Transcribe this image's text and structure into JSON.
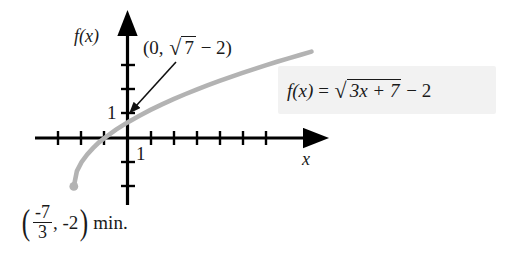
{
  "figure": {
    "background_color": "#ffffff",
    "curve_color": "#b3b3b3",
    "axis_color": "#000000",
    "text_color": "#1a1a1a",
    "callout_bg": "#f2f2f2"
  },
  "labels": {
    "y_axis": "f(x)",
    "x_axis": "x",
    "y_tick_one": "1",
    "x_tick_one": "1"
  },
  "annotations": {
    "intercept": {
      "open": "(0,",
      "radical_symbol": "√",
      "radicand": "7",
      "tail": "− 2)"
    },
    "equation": {
      "lhs": "f(x)",
      "equals": "=",
      "radical_symbol": "√",
      "radicand": "3x + 7",
      "tail": "− 2"
    },
    "minimum": {
      "open_paren": "(",
      "numerator": "-7",
      "denominator": "3",
      "comma_value": ", -2",
      "close_paren": ")",
      "note": "min."
    }
  },
  "chart_data": {
    "type": "line",
    "title": "",
    "xlabel": "x",
    "ylabel": "f(x)",
    "function": "f(x) = sqrt(3x + 7) - 2",
    "domain": [
      -2.3333333,
      8.0
    ],
    "xlim": [
      -4.0,
      8.5
    ],
    "ylim": [
      -3.2,
      3.4
    ],
    "grid": false,
    "legend": null,
    "x_ticks": [
      -3,
      -2,
      -1,
      1,
      2,
      3,
      4,
      5,
      6,
      7
    ],
    "y_ticks": [
      -2,
      -1,
      1,
      2,
      3
    ],
    "labeled_x_ticks": [
      {
        "value": 1,
        "label": "1"
      }
    ],
    "labeled_y_ticks": [
      {
        "value": 1,
        "label": "1"
      }
    ],
    "key_points": [
      {
        "name": "y-intercept",
        "x": 0,
        "y": 0.6457513,
        "label": "(0, √7 − 2)"
      },
      {
        "name": "minimum-endpoint",
        "x": -2.3333333,
        "y": -2,
        "label": "(-7/3, -2) min."
      },
      {
        "name": "x-intercept",
        "x": -1,
        "y": 0
      }
    ],
    "series": [
      {
        "name": "f(x) = sqrt(3x + 7) - 2",
        "x": [
          -2.3333,
          -2.2,
          -2.0,
          -1.75,
          -1.5,
          -1.25,
          -1.0,
          -0.5,
          0.0,
          0.5,
          1.0,
          1.5,
          2.0,
          2.5,
          3.0,
          3.5,
          4.0,
          4.5,
          5.0,
          5.5,
          6.0,
          6.5,
          7.0,
          7.5,
          8.0
        ],
        "y": [
          -2.0,
          -1.368,
          -1.0,
          -0.677,
          -0.418,
          -0.19,
          0.0,
          0.347,
          0.646,
          0.913,
          1.162,
          1.391,
          1.606,
          1.808,
          2.0,
          2.183,
          2.359,
          2.528,
          2.69,
          2.848,
          3.0,
          3.148,
          3.292,
          3.432,
          3.568
        ]
      }
    ],
    "callout_arrow": {
      "from_label": "(0, √7 − 2)",
      "points_to": {
        "x": 0,
        "y": 0.6457513
      }
    }
  }
}
